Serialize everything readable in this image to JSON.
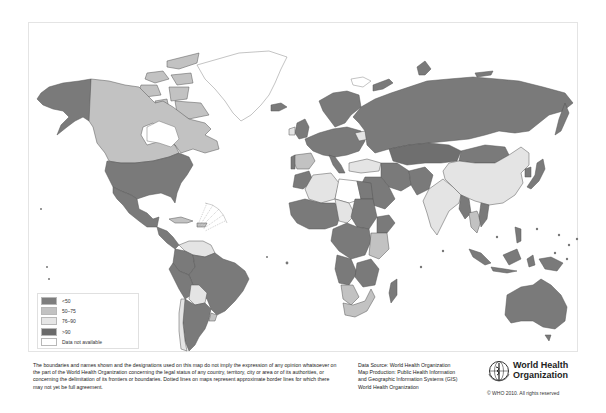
{
  "map": {
    "type": "choropleth",
    "colors": {
      "lt50": "#7a7a7a",
      "50_75": "#bdbdbd",
      "76_90": "#e4e4e4",
      "gt90": "#6f6f6f",
      "na": "#ffffff",
      "border": "#4a4a4a"
    },
    "legend": {
      "items": [
        {
          "label": "<50",
          "color": "#7d7d7d"
        },
        {
          "label": "50–75",
          "color": "#c2c2c2"
        },
        {
          "label": "76–90",
          "color": "#e6e6e6"
        },
        {
          "label": ">90",
          "color": "#6b6b6b"
        },
        {
          "label": "Data not available",
          "color": "#ffffff"
        }
      ]
    }
  },
  "footer": {
    "disclaimer": "The boundaries and names shown and the designations used on this map do not imply the expression of any opinion whatsoever on the part of the World Health Organization concerning the legal status of any country, territory, city or area or of its authorities, or concerning the delimitation of its frontiers or boundaries. Dotted lines on maps represent approximate border lines for which there may not yet be full agreement.",
    "source_lines": [
      "Data Source: World Health Organization",
      "Map Production: Public Health Information",
      "and Geographic Information Systems (GIS)",
      "World Health Organization"
    ],
    "org_name_line1": "World Health",
    "org_name_line2": "Organization",
    "copyright": "© WHO 2010. All rights reserved"
  }
}
